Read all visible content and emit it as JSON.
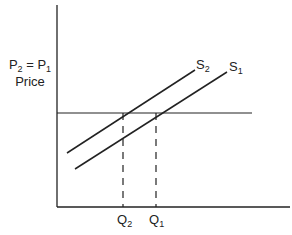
{
  "diagram": {
    "type": "supply-shift",
    "y_axis_label": "Price",
    "price_label": {
      "left": "P",
      "left_sub": "2",
      "eq": " = ",
      "right": "P",
      "right_sub": "1"
    },
    "curves": [
      {
        "id": "S2",
        "base": "S",
        "sub": "2",
        "x1": 67,
        "y1": 153,
        "x2": 195,
        "y2": 70
      },
      {
        "id": "S1",
        "base": "S",
        "sub": "1",
        "x1": 75,
        "y1": 169,
        "x2": 227,
        "y2": 72
      }
    ],
    "price_line": {
      "y": 113,
      "x1": 57,
      "x2": 252
    },
    "quantities": [
      {
        "id": "Q2",
        "base": "Q",
        "sub": "2",
        "x": 123
      },
      {
        "id": "Q1",
        "base": "Q",
        "sub": "1",
        "x": 156
      }
    ],
    "axes": {
      "origin_x": 57,
      "origin_y": 207,
      "top_y": 5,
      "right_x": 290
    },
    "colors": {
      "line": "#222222",
      "background": "#ffffff"
    }
  }
}
